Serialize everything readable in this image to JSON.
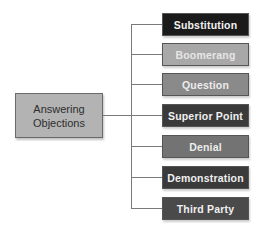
{
  "root": {
    "label_line1": "Answering",
    "label_line2": "Objections",
    "fill": "#b3b3b3"
  },
  "nodes": [
    {
      "label": "Substitution",
      "fill": "#1a1a1a",
      "text_color": "#f2f2f2"
    },
    {
      "label": "Boomerang",
      "fill": "#a8a8a8",
      "text_color": "#e6e6e6"
    },
    {
      "label": "Question",
      "fill": "#8a8a8a",
      "text_color": "#ececec"
    },
    {
      "label": "Superior Point",
      "fill": "#3a3a3a",
      "text_color": "#f0f0f0"
    },
    {
      "label": "Denial",
      "fill": "#737373",
      "text_color": "#ececec"
    },
    {
      "label": "Demonstration",
      "fill": "#3a3a3a",
      "text_color": "#f0f0f0"
    },
    {
      "label": "Third Party",
      "fill": "#4a4a4a",
      "text_color": "#f0f0f0"
    }
  ]
}
